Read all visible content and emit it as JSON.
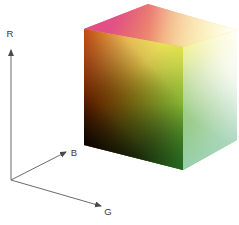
{
  "figure": {
    "background": "#ffffff",
    "width": 239,
    "height": 225
  },
  "axes": {
    "origin": {
      "x": 11,
      "y": 180
    },
    "color": "#5a5a5a",
    "items": [
      {
        "name": "r-axis",
        "label": "R",
        "label_x": 10,
        "label_y": 37,
        "tip_x": 11,
        "tip_y": 50,
        "direction": "up"
      },
      {
        "name": "b-axis",
        "label": "B",
        "label_x": 74,
        "label_y": 156,
        "tip_x": 66,
        "tip_y": 152,
        "direction": "up-right"
      },
      {
        "name": "g-axis",
        "label": "G",
        "label_x": 106,
        "label_y": 215,
        "tip_x": 101,
        "tip_y": 206,
        "direction": "down-right"
      }
    ]
  },
  "cube": {
    "name": "rgb-colour-cube",
    "vertices": {
      "left": {
        "x": 84,
        "y": 29,
        "color": "#ff3000",
        "meaning": "red"
      },
      "top_apex": {
        "x": 148,
        "y": 4,
        "color": "#e0508c",
        "meaning": "magenta"
      },
      "right": {
        "x": 237,
        "y": 30,
        "color": "#ffffff",
        "meaning": "white"
      },
      "front_top": {
        "x": 183,
        "y": 47,
        "color": "#f2e83c",
        "meaning": "yellow"
      },
      "left_bottom": {
        "x": 84,
        "y": 145,
        "color": "#0d0d0d",
        "meaning": "black"
      },
      "front_bottom": {
        "x": 183,
        "y": 170,
        "color": "#3fa83f",
        "meaning": "green"
      },
      "right_bottom": {
        "x": 237,
        "y": 140,
        "color": "#8fc8b4",
        "meaning": "cyan"
      }
    },
    "faces": [
      {
        "name": "cube-face-top",
        "corners": [
          "left",
          "top_apex",
          "right",
          "front_top"
        ],
        "corner_colors": [
          "#ff3000",
          "#d9488c",
          "#ffffff",
          "#f7e84a"
        ]
      },
      {
        "name": "cube-face-left",
        "corners": [
          "left",
          "front_top",
          "front_bottom",
          "left_bottom"
        ],
        "corner_colors": [
          "#ff2e00",
          "#f2e83c",
          "#3aa33a",
          "#0d0d0d"
        ]
      },
      {
        "name": "cube-face-right",
        "corners": [
          "front_top",
          "right",
          "right_bottom",
          "front_bottom"
        ],
        "corner_colors": [
          "#f2e83c",
          "#ffffff",
          "#a8d8c4",
          "#3fa83f"
        ]
      }
    ]
  }
}
